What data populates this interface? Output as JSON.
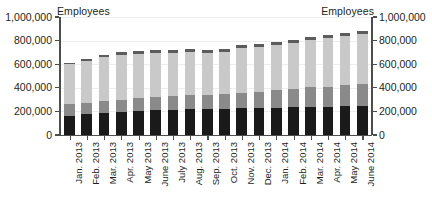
{
  "axis_titles": {
    "left": "Employees",
    "right": "Employees"
  },
  "chart_data": {
    "type": "bar",
    "stacked": true,
    "title": "",
    "subtitle": "",
    "xlabel": "",
    "ylabel": "Employees",
    "y2label": "Employees",
    "ylim": [
      0,
      1000000
    ],
    "y2lim": [
      0,
      1000000
    ],
    "ytick_labels": [
      "0",
      "200,000",
      "400,000",
      "600,000",
      "800,000",
      "1,000,000"
    ],
    "ytick_values": [
      0,
      200000,
      400000,
      600000,
      800000,
      1000000
    ],
    "grid": true,
    "legend": "none",
    "categories": [
      "Jan. 2013",
      "Feb. 2013",
      "Mar. 2013",
      "Apr. 2013",
      "May 2013",
      "June 2013",
      "July 2013",
      "Aug. 2013",
      "Sep. 2013",
      "Oct. 2013",
      "Nov. 2013",
      "Dec. 2013",
      "Jan. 2014",
      "Feb. 2014",
      "Mar. 2014",
      "Apr. 2014",
      "May 2014",
      "June 2014"
    ],
    "series": [
      {
        "name": "series-1",
        "color": "#1a1a1a",
        "values": [
          165000,
          180000,
          185000,
          195000,
          205000,
          215000,
          215000,
          220000,
          220000,
          220000,
          225000,
          225000,
          230000,
          235000,
          240000,
          240000,
          245000,
          250000
        ]
      },
      {
        "name": "series-2",
        "color": "#8a8a8a",
        "values": [
          95000,
          95000,
          100000,
          105000,
          105000,
          110000,
          115000,
          120000,
          120000,
          125000,
          130000,
          140000,
          150000,
          155000,
          165000,
          170000,
          175000,
          180000
        ]
      },
      {
        "name": "series-3",
        "color": "#c9c9c9",
        "values": [
          340000,
          355000,
          375000,
          380000,
          375000,
          370000,
          365000,
          360000,
          355000,
          355000,
          385000,
          380000,
          385000,
          390000,
          400000,
          410000,
          420000,
          425000
        ]
      },
      {
        "name": "series-4",
        "color": "#5c5c5c",
        "values": [
          10000,
          15000,
          20000,
          25000,
          25000,
          25000,
          25000,
          25000,
          25000,
          25000,
          25000,
          25000,
          25000,
          25000,
          25000,
          25000,
          25000,
          25000
        ]
      }
    ],
    "totals": [
      610000,
      645000,
      680000,
      705000,
      710000,
      720000,
      720000,
      725000,
      720000,
      725000,
      765000,
      770000,
      790000,
      805000,
      830000,
      845000,
      865000,
      880000
    ]
  }
}
